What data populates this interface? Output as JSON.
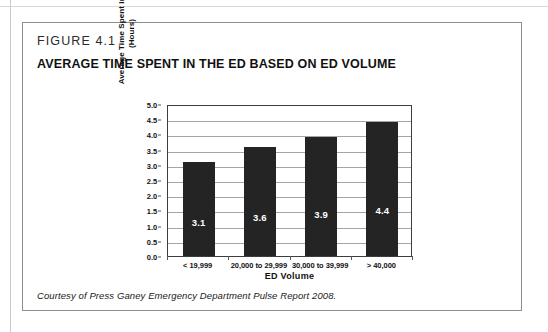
{
  "figure": {
    "number": "FIGURE 4.1",
    "title": "AVERAGE TIME SPENT IN THE ED BASED ON ED VOLUME",
    "caption": "Courtesy of Press Ganey Emergency Department Pulse Report 2008."
  },
  "colors": {
    "bar": "#242424",
    "gridline": "#a5a5a5",
    "axis": "#3d3d3d",
    "bar_label": "#ffffff",
    "figure_border": "#8d8d8d"
  },
  "chart_data": {
    "type": "bar",
    "title": "AVERAGE TIME SPENT IN THE ED BASED ON ED VOLUME",
    "categories": [
      "< 19,999",
      "20,000 to 29,999",
      "30,000 to 39,999",
      "> 40,000"
    ],
    "values": [
      3.1,
      3.6,
      3.9,
      4.4
    ],
    "data_labels": [
      "3.1",
      "3.6",
      "3.9",
      "4.4"
    ],
    "xlabel": "ED Volume",
    "ylabel": "Average Time Spent in ED (Hours)",
    "ylabel_line1": "Average Time Spent in ED",
    "ylabel_line2": "(Hours)",
    "ylim": [
      0.0,
      5.0
    ],
    "ytick_step": 0.5,
    "yticks": [
      0.0,
      0.5,
      1.0,
      1.5,
      2.0,
      2.5,
      3.0,
      3.5,
      4.0,
      4.5,
      5.0
    ],
    "ytick_labels": [
      "0.0",
      "0.5",
      "1.0",
      "1.5",
      "2.0",
      "2.5",
      "3.0",
      "3.5",
      "4.0",
      "4.5",
      "5.0"
    ],
    "grid": true,
    "grid_axis": "y",
    "legend": false,
    "legend_position": "none"
  }
}
